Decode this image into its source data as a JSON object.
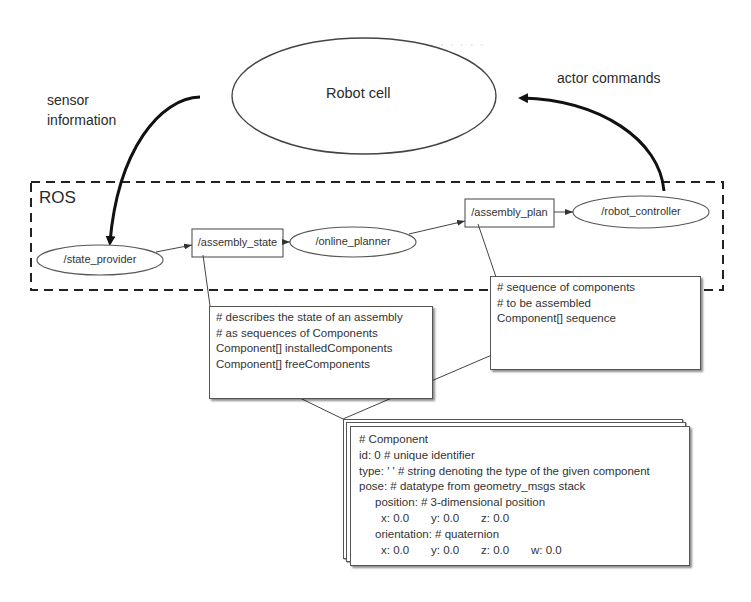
{
  "diagram": {
    "external": {
      "robot_cell": "Robot cell",
      "sensor_label_line1": "sensor",
      "sensor_label_line2": "information",
      "actor_label": "actor commands"
    },
    "ros_group": {
      "label": "ROS"
    },
    "nodes": [
      {
        "id": "state_provider",
        "label": "/state_provider",
        "shape": "ellipse"
      },
      {
        "id": "assembly_state",
        "label": "/assembly_state",
        "shape": "rect"
      },
      {
        "id": "online_planner",
        "label": "/online_planner",
        "shape": "ellipse"
      },
      {
        "id": "assembly_plan",
        "label": "/assembly_plan",
        "shape": "rect"
      },
      {
        "id": "robot_controller",
        "label": "/robot_controller",
        "shape": "ellipse"
      }
    ],
    "edges": [
      {
        "from": "state_provider",
        "to": "assembly_state"
      },
      {
        "from": "assembly_state",
        "to": "online_planner"
      },
      {
        "from": "online_planner",
        "to": "assembly_plan"
      },
      {
        "from": "assembly_plan",
        "to": "robot_controller"
      },
      {
        "from": "robot_cell",
        "to": "state_provider",
        "label": "sensor information"
      },
      {
        "from": "robot_controller",
        "to": "robot_cell",
        "label": "actor commands"
      }
    ],
    "notes": {
      "assembly_state": [
        "# describes  the state of an assembly",
        "# as sequences  of Components",
        "Component[]  installedComponents",
        "Component[]  freeComponents"
      ],
      "assembly_plan": [
        "# sequence  of components",
        "# to be assembled",
        "Component[]  sequence"
      ]
    },
    "component_msg": {
      "title": "# Component",
      "id_line": "id: 0 # unique identifier",
      "type_line": "type: ' ' # string denoting the type of the given component",
      "pose_line": "pose: # datatype from geometry_msgs stack",
      "position_line": "position: # 3-dimensional position",
      "position_values": {
        "x": "x: 0.0",
        "y": "y: 0.0",
        "z": "z: 0.0"
      },
      "orientation_line": "orientation:  # quaternion",
      "orientation_values": {
        "x": "x: 0.0",
        "y": "y: 0.0",
        "z": "z: 0.0",
        "w": "w: 0.0"
      }
    }
  }
}
